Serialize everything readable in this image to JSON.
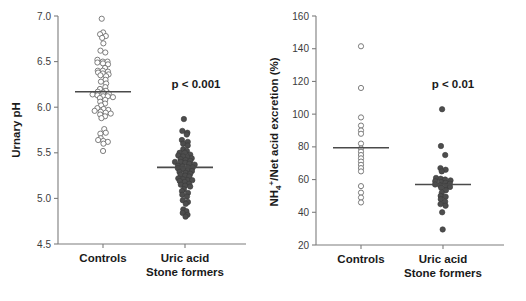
{
  "figure": {
    "background": "#ffffff",
    "width": 526,
    "height": 301
  },
  "colors": {
    "axis": "#7d7d7d",
    "text": "#1a1a1a",
    "tick_text": "#3b3b3b",
    "mean_line": "#4a4a4a",
    "open_marker_fill": "#ffffff",
    "open_marker_stroke": "#6e6e6e",
    "filled_marker": "#4d4d4d"
  },
  "panels": [
    {
      "id": "panel-ph",
      "ylabel": "Urnary pH",
      "ylim": [
        4.5,
        7.0
      ],
      "yticks": [
        4.5,
        5.0,
        5.5,
        6.0,
        6.5,
        7.0
      ],
      "ytick_labels": [
        "4.5",
        "5.0",
        "5.5",
        "6.0",
        "6.5",
        "7.0"
      ],
      "annotation": "p < 0.001",
      "groups": [
        {
          "label": "Controls",
          "marker": "open",
          "mean": 6.17,
          "n": 61,
          "values": [
            6.97,
            6.82,
            6.8,
            6.78,
            6.76,
            6.7,
            6.62,
            6.6,
            6.52,
            6.5,
            6.5,
            6.49,
            6.48,
            6.47,
            6.43,
            6.4,
            6.4,
            6.39,
            6.38,
            6.37,
            6.36,
            6.35,
            6.34,
            6.3,
            6.28,
            6.26,
            6.22,
            6.2,
            6.18,
            6.17,
            6.16,
            6.15,
            6.14,
            6.13,
            6.12,
            6.12,
            6.11,
            6.1,
            6.08,
            6.06,
            6.04,
            6.02,
            5.99,
            5.98,
            5.97,
            5.96,
            5.95,
            5.94,
            5.93,
            5.92,
            5.9,
            5.88,
            5.76,
            5.72,
            5.71,
            5.66,
            5.64,
            5.63,
            5.62,
            5.6,
            5.52
          ]
        },
        {
          "label": "Uric acid\nStone formers",
          "marker": "filled",
          "mean": 5.34,
          "n": 62,
          "values": [
            5.87,
            5.74,
            5.72,
            5.7,
            5.64,
            5.62,
            5.6,
            5.58,
            5.54,
            5.52,
            5.5,
            5.5,
            5.48,
            5.47,
            5.46,
            5.45,
            5.44,
            5.43,
            5.42,
            5.41,
            5.4,
            5.4,
            5.39,
            5.38,
            5.37,
            5.36,
            5.35,
            5.34,
            5.34,
            5.33,
            5.32,
            5.31,
            5.3,
            5.29,
            5.28,
            5.27,
            5.26,
            5.25,
            5.24,
            5.22,
            5.21,
            5.2,
            5.2,
            5.19,
            5.18,
            5.16,
            5.15,
            5.14,
            5.13,
            5.1,
            5.08,
            5.06,
            5.04,
            5.02,
            4.98,
            4.96,
            4.94,
            4.88,
            4.86,
            4.84,
            4.82,
            4.8
          ]
        }
      ]
    },
    {
      "id": "panel-nh4",
      "ylabel": "NH4+/Net acid excretion (%)",
      "ylabel_base": "NH",
      "ylabel_sub": "4",
      "ylabel_sup": "+",
      "ylabel_rest": "/Net acid excretion (%)",
      "ylim": [
        20,
        160
      ],
      "yticks": [
        20,
        40,
        60,
        80,
        100,
        120,
        140,
        160
      ],
      "ytick_labels": [
        "20",
        "40",
        "60",
        "80",
        "100",
        "120",
        "140",
        "160"
      ],
      "annotation": "p < 0.01",
      "groups": [
        {
          "label": "Controls",
          "marker": "open",
          "mean": 79.5,
          "n": 19,
          "values": [
            141.5,
            116.0,
            98.0,
            93.0,
            90.0,
            88.0,
            82.0,
            79.0,
            77.0,
            75.0,
            73.0,
            71.0,
            69.0,
            67.0,
            65.0,
            56.0,
            52.0,
            49.0,
            46.0
          ]
        },
        {
          "label": "Uric acid\nStone formers",
          "marker": "filled",
          "mean": 57.0,
          "n": 29,
          "values": [
            103.0,
            80.5,
            75.0,
            67.0,
            66.0,
            65.0,
            61.0,
            60.5,
            60.0,
            59.5,
            59.0,
            58.5,
            58.0,
            57.5,
            57.0,
            56.5,
            56.0,
            55.5,
            55.0,
            53.5,
            52.0,
            50.0,
            49.5,
            48.0,
            46.5,
            45.0,
            44.0,
            40.0,
            29.5
          ]
        }
      ]
    }
  ],
  "chart_data": {
    "type": "scatter",
    "title": "",
    "subplots": [
      {
        "title": "",
        "ylabel": "Urnary pH",
        "xlabel": "",
        "ylim": [
          4.5,
          7.0
        ],
        "yticks": [
          4.5,
          5.0,
          5.5,
          6.0,
          6.5,
          7.0
        ],
        "grid": false,
        "legend": "none",
        "categories": [
          "Controls",
          "Uric acid Stone formers"
        ],
        "annotations": [
          "p < 0.001"
        ],
        "series": [
          {
            "name": "Controls",
            "marker": "open-circle",
            "mean": 6.17,
            "n": 61,
            "values": [
              6.97,
              6.82,
              6.8,
              6.78,
              6.76,
              6.7,
              6.62,
              6.6,
              6.52,
              6.5,
              6.5,
              6.49,
              6.48,
              6.47,
              6.43,
              6.4,
              6.4,
              6.39,
              6.38,
              6.37,
              6.36,
              6.35,
              6.34,
              6.3,
              6.28,
              6.26,
              6.22,
              6.2,
              6.18,
              6.17,
              6.16,
              6.15,
              6.14,
              6.13,
              6.12,
              6.12,
              6.11,
              6.1,
              6.08,
              6.06,
              6.04,
              6.02,
              5.99,
              5.98,
              5.97,
              5.96,
              5.95,
              5.94,
              5.93,
              5.92,
              5.9,
              5.88,
              5.76,
              5.72,
              5.71,
              5.66,
              5.64,
              5.63,
              5.62,
              5.6,
              5.52
            ]
          },
          {
            "name": "Uric acid Stone formers",
            "marker": "filled-circle",
            "mean": 5.34,
            "n": 62,
            "values": [
              5.87,
              5.74,
              5.72,
              5.7,
              5.64,
              5.62,
              5.6,
              5.58,
              5.54,
              5.52,
              5.5,
              5.5,
              5.48,
              5.47,
              5.46,
              5.45,
              5.44,
              5.43,
              5.42,
              5.41,
              5.4,
              5.4,
              5.39,
              5.38,
              5.37,
              5.36,
              5.35,
              5.34,
              5.34,
              5.33,
              5.32,
              5.31,
              5.3,
              5.29,
              5.28,
              5.27,
              5.26,
              5.25,
              5.24,
              5.22,
              5.21,
              5.2,
              5.2,
              5.19,
              5.18,
              5.16,
              5.15,
              5.14,
              5.13,
              5.1,
              5.08,
              5.06,
              5.04,
              5.02,
              4.98,
              4.96,
              4.94,
              4.88,
              4.86,
              4.84,
              4.82,
              4.8
            ]
          }
        ]
      },
      {
        "title": "",
        "ylabel": "NH4+/Net acid excretion (%)",
        "xlabel": "",
        "ylim": [
          20,
          160
        ],
        "yticks": [
          20,
          40,
          60,
          80,
          100,
          120,
          140,
          160
        ],
        "grid": false,
        "legend": "none",
        "categories": [
          "Controls",
          "Uric acid Stone formers"
        ],
        "annotations": [
          "p < 0.01"
        ],
        "series": [
          {
            "name": "Controls",
            "marker": "open-circle",
            "mean": 79.5,
            "n": 19,
            "values": [
              141.5,
              116.0,
              98.0,
              93.0,
              90.0,
              88.0,
              82.0,
              79.0,
              77.0,
              75.0,
              73.0,
              71.0,
              69.0,
              67.0,
              65.0,
              56.0,
              52.0,
              49.0,
              46.0
            ]
          },
          {
            "name": "Uric acid Stone formers",
            "marker": "filled-circle",
            "mean": 57.0,
            "n": 29,
            "values": [
              103.0,
              80.5,
              75.0,
              67.0,
              66.0,
              65.0,
              61.0,
              60.5,
              60.0,
              59.5,
              59.0,
              58.5,
              58.0,
              57.5,
              57.0,
              56.5,
              56.0,
              55.5,
              55.0,
              53.5,
              52.0,
              50.0,
              49.5,
              48.0,
              46.5,
              45.0,
              44.0,
              40.0,
              29.5
            ]
          }
        ]
      }
    ]
  }
}
